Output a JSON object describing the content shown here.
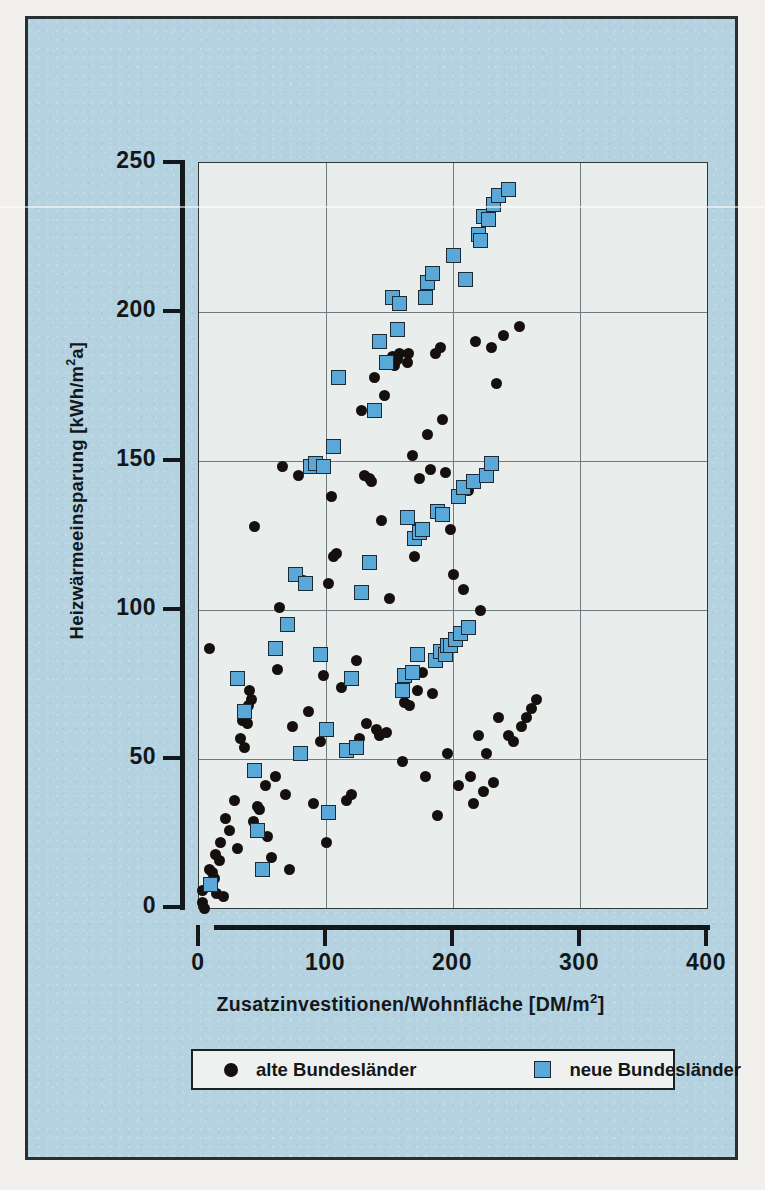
{
  "chart_data": {
    "type": "scatter",
    "title": "",
    "xlabel": "Zusatzinvestitionen/Wohnfläche [DM/m2]",
    "ylabel": "Heizwärmeeinsparung [kWh/m2a]",
    "xlim": [
      0,
      400
    ],
    "ylim": [
      0,
      250
    ],
    "xticks": [
      0,
      100,
      200,
      300,
      400
    ],
    "yticks": [
      0,
      50,
      100,
      150,
      200,
      250
    ],
    "grid": true,
    "legend_position": "below-plot",
    "series": [
      {
        "name": "alte Bundesländer",
        "marker": "circle",
        "color": "#15100e",
        "points": [
          [
            3,
            6
          ],
          [
            3,
            2
          ],
          [
            4,
            0
          ],
          [
            8,
            13
          ],
          [
            9,
            9
          ],
          [
            11,
            12
          ],
          [
            12,
            10
          ],
          [
            13,
            18
          ],
          [
            14,
            5
          ],
          [
            16,
            16
          ],
          [
            17,
            22
          ],
          [
            19,
            4
          ],
          [
            8,
            87
          ],
          [
            21,
            30
          ],
          [
            24,
            26
          ],
          [
            28,
            36
          ],
          [
            30,
            20
          ],
          [
            33,
            57
          ],
          [
            34,
            63
          ],
          [
            36,
            54
          ],
          [
            38,
            62
          ],
          [
            39,
            68
          ],
          [
            40,
            73
          ],
          [
            41,
            70
          ],
          [
            43,
            29
          ],
          [
            44,
            128
          ],
          [
            46,
            34
          ],
          [
            48,
            33
          ],
          [
            52,
            41
          ],
          [
            54,
            24
          ],
          [
            57,
            17
          ],
          [
            60,
            44
          ],
          [
            62,
            80
          ],
          [
            63,
            101
          ],
          [
            66,
            148
          ],
          [
            68,
            38
          ],
          [
            71,
            13
          ],
          [
            74,
            61
          ],
          [
            78,
            145
          ],
          [
            82,
            110
          ],
          [
            86,
            66
          ],
          [
            90,
            35
          ],
          [
            96,
            56
          ],
          [
            98,
            78
          ],
          [
            100,
            22
          ],
          [
            102,
            109
          ],
          [
            104,
            138
          ],
          [
            106,
            118
          ],
          [
            108,
            119
          ],
          [
            112,
            74
          ],
          [
            116,
            36
          ],
          [
            120,
            38
          ],
          [
            124,
            83
          ],
          [
            126,
            57
          ],
          [
            128,
            167
          ],
          [
            130,
            145
          ],
          [
            132,
            62
          ],
          [
            134,
            144
          ],
          [
            136,
            143
          ],
          [
            138,
            178
          ],
          [
            140,
            60
          ],
          [
            142,
            58
          ],
          [
            144,
            130
          ],
          [
            146,
            172
          ],
          [
            148,
            59
          ],
          [
            150,
            104
          ],
          [
            152,
            185
          ],
          [
            154,
            182
          ],
          [
            156,
            184
          ],
          [
            158,
            186
          ],
          [
            160,
            49
          ],
          [
            162,
            69
          ],
          [
            164,
            183
          ],
          [
            165,
            186
          ],
          [
            166,
            68
          ],
          [
            168,
            152
          ],
          [
            170,
            118
          ],
          [
            172,
            73
          ],
          [
            174,
            144
          ],
          [
            176,
            79
          ],
          [
            178,
            44
          ],
          [
            180,
            159
          ],
          [
            182,
            147
          ],
          [
            184,
            72
          ],
          [
            186,
            186
          ],
          [
            188,
            31
          ],
          [
            190,
            188
          ],
          [
            192,
            164
          ],
          [
            194,
            146
          ],
          [
            196,
            52
          ],
          [
            198,
            127
          ],
          [
            200,
            112
          ],
          [
            204,
            41
          ],
          [
            208,
            107
          ],
          [
            212,
            140
          ],
          [
            214,
            44
          ],
          [
            216,
            35
          ],
          [
            218,
            190
          ],
          [
            220,
            58
          ],
          [
            222,
            100
          ],
          [
            224,
            39
          ],
          [
            226,
            52
          ],
          [
            230,
            188
          ],
          [
            232,
            42
          ],
          [
            234,
            176
          ],
          [
            236,
            64
          ],
          [
            240,
            192
          ],
          [
            244,
            58
          ],
          [
            248,
            56
          ],
          [
            252,
            195
          ],
          [
            254,
            61
          ],
          [
            258,
            64
          ],
          [
            262,
            67
          ],
          [
            266,
            70
          ]
        ]
      },
      {
        "name": "neue Bundesländer",
        "marker": "square",
        "color": "#59a8d8",
        "points": [
          [
            9,
            8
          ],
          [
            30,
            77
          ],
          [
            36,
            66
          ],
          [
            44,
            46
          ],
          [
            46,
            26
          ],
          [
            50,
            13
          ],
          [
            60,
            87
          ],
          [
            70,
            95
          ],
          [
            76,
            112
          ],
          [
            80,
            52
          ],
          [
            84,
            109
          ],
          [
            88,
            148
          ],
          [
            92,
            149
          ],
          [
            96,
            85
          ],
          [
            98,
            148
          ],
          [
            100,
            60
          ],
          [
            102,
            32
          ],
          [
            106,
            155
          ],
          [
            110,
            178
          ],
          [
            116,
            53
          ],
          [
            120,
            77
          ],
          [
            124,
            54
          ],
          [
            128,
            106
          ],
          [
            134,
            116
          ],
          [
            138,
            167
          ],
          [
            142,
            190
          ],
          [
            148,
            183
          ],
          [
            152,
            205
          ],
          [
            156,
            194
          ],
          [
            158,
            203
          ],
          [
            160,
            73
          ],
          [
            162,
            78
          ],
          [
            164,
            131
          ],
          [
            168,
            79
          ],
          [
            170,
            124
          ],
          [
            172,
            85
          ],
          [
            174,
            126
          ],
          [
            176,
            127
          ],
          [
            178,
            205
          ],
          [
            180,
            210
          ],
          [
            184,
            213
          ],
          [
            186,
            83
          ],
          [
            188,
            133
          ],
          [
            190,
            86
          ],
          [
            192,
            132
          ],
          [
            194,
            85
          ],
          [
            196,
            88
          ],
          [
            198,
            88
          ],
          [
            200,
            219
          ],
          [
            202,
            90
          ],
          [
            204,
            138
          ],
          [
            206,
            92
          ],
          [
            208,
            141
          ],
          [
            210,
            211
          ],
          [
            212,
            94
          ],
          [
            216,
            143
          ],
          [
            220,
            226
          ],
          [
            222,
            224
          ],
          [
            224,
            232
          ],
          [
            226,
            145
          ],
          [
            228,
            231
          ],
          [
            230,
            149
          ],
          [
            232,
            236
          ],
          [
            236,
            239
          ],
          [
            244,
            241
          ]
        ]
      }
    ]
  },
  "axis": {
    "y_tick_labels": [
      "0",
      "50",
      "100",
      "150",
      "200",
      "250"
    ],
    "x_tick_labels": [
      "0",
      "100",
      "200",
      "300",
      "400"
    ],
    "ylabel_prefix": "Heizwärmeeinsparung [kWh/m",
    "ylabel_sup": "2",
    "ylabel_suffix": "a]",
    "xlabel_prefix": "Zusatzinvestitionen/Wohnfläche [DM/m",
    "xlabel_sup": "2",
    "xlabel_suffix": "]"
  },
  "legend": {
    "entries": [
      {
        "label": "alte Bundesländer",
        "marker": "circle",
        "color": "#15100e"
      },
      {
        "label": "neue Bundesländer",
        "marker": "square",
        "color": "#59a8d8"
      }
    ]
  },
  "colors": {
    "panel_background": "#b4d2e0",
    "plot_background": "#e9eeec",
    "frame": "#31383c",
    "gridline": "#6e7a7e",
    "axis": "#15181b",
    "text": "#14171a",
    "page_background": "#f2f0ec"
  }
}
